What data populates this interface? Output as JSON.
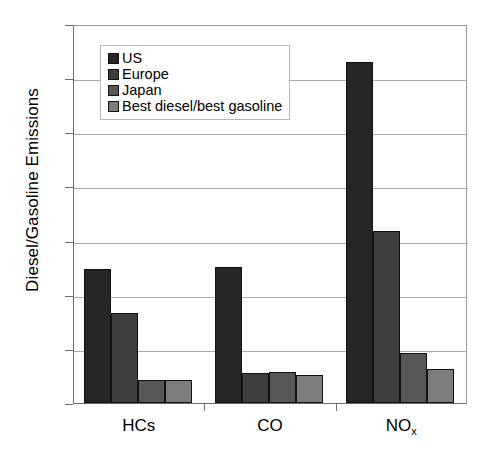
{
  "chart_data": {
    "type": "bar",
    "title": "",
    "xlabel": "",
    "ylabel": "Diesel/Gasoline Emissions",
    "categories": [
      "HCs",
      "CO",
      "NOx"
    ],
    "category_labels_html": [
      "HCs",
      "CO",
      "NO<sub>x</sub>"
    ],
    "ylim": [
      0,
      7
    ],
    "y_ticks": [
      0,
      1,
      2,
      3,
      4,
      5,
      6,
      7
    ],
    "grid": "horizontal",
    "legend_position": "top-left-inside",
    "series": [
      {
        "name": "US",
        "color": "#262626",
        "values": [
          2.47,
          2.51,
          6.3
        ]
      },
      {
        "name": "Europe",
        "color": "#3d3d3d",
        "values": [
          1.67,
          0.55,
          3.18
        ]
      },
      {
        "name": "Japan",
        "color": "#575757",
        "values": [
          0.42,
          0.57,
          0.93
        ]
      },
      {
        "name": "Best diesel/best gasoline",
        "color": "#7d7d7d",
        "values": [
          0.43,
          0.52,
          0.62
        ]
      }
    ]
  },
  "axes": {
    "y_title": "Diesel/Gasoline Emissions",
    "y_tick_labels": [
      "0",
      "1",
      "2",
      "3",
      "4",
      "5",
      "6",
      "7"
    ]
  },
  "legend": {
    "items": [
      {
        "label": "US"
      },
      {
        "label": "Europe"
      },
      {
        "label": "Japan"
      },
      {
        "label": "Best diesel/best gasoline"
      }
    ]
  }
}
